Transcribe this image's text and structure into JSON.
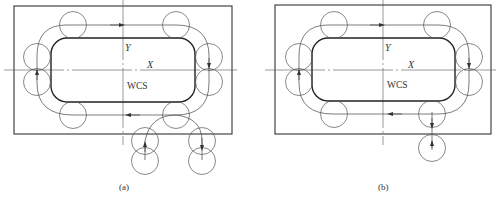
{
  "figures": [
    {
      "id": "a",
      "caption": "(a)",
      "axis_x_label": "X",
      "axis_y_label": "Y",
      "origin_label": "WCS",
      "lead_in_count": 2
    },
    {
      "id": "b",
      "caption": "(b)",
      "axis_x_label": "X",
      "axis_y_label": "Y",
      "origin_label": "WCS",
      "lead_in_count": 1
    }
  ],
  "colors": {
    "line": "#3a3a3a",
    "thin": "#555555",
    "background": "#ffffff"
  }
}
